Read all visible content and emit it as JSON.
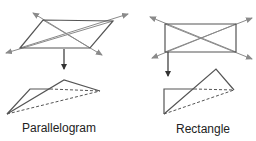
{
  "colors": {
    "edge": "#555555",
    "diagonal": "#8a8a8a",
    "arrow": "#333333",
    "label": "#222222"
  },
  "figures": [
    {
      "id": "parallelogram",
      "label": "Parallelogram",
      "label_pos": [
        22,
        121
      ],
      "shape": [
        [
          43,
          20
        ],
        [
          113,
          21
        ],
        [
          90,
          48
        ],
        [
          20,
          48
        ]
      ],
      "diagonal_arrows": [
        {
          "from": [
            90,
            48
          ],
          "to": [
            33,
            13
          ]
        },
        {
          "from": [
            20,
            48
          ],
          "to": [
            128,
            14
          ]
        },
        {
          "from": [
            113,
            21
          ],
          "to": [
            6,
            53
          ]
        },
        {
          "from": [
            43,
            20
          ],
          "to": [
            102,
            55
          ]
        }
      ],
      "fold_arrow": {
        "x": 64,
        "y1": 49,
        "y2": 69
      },
      "folded": {
        "solid": [
          [
            [
              7,
              114
            ],
            [
              30,
              89
            ],
            [
              50,
              89
            ]
          ],
          [
            [
              7,
              114
            ],
            [
              64,
              80
            ],
            [
              100,
              91
            ]
          ]
        ],
        "dashed": [
          [
            [
              50,
              89
            ],
            [
              100,
              91
            ]
          ],
          [
            [
              7,
              114
            ],
            [
              100,
              91
            ]
          ]
        ]
      }
    },
    {
      "id": "rectangle",
      "label": "Rectangle",
      "label_pos": [
        176,
        122
      ],
      "shape": [
        [
          165,
          24
        ],
        [
          236,
          24
        ],
        [
          236,
          52
        ],
        [
          165,
          52
        ]
      ],
      "diagonal_arrows": [
        {
          "from": [
            236,
            52
          ],
          "to": [
            150,
            17
          ]
        },
        {
          "from": [
            165,
            52
          ],
          "to": [
            252,
            18
          ]
        },
        {
          "from": [
            236,
            24
          ],
          "to": [
            152,
            58
          ]
        },
        {
          "from": [
            165,
            24
          ],
          "to": [
            252,
            59
          ]
        }
      ],
      "fold_arrow": {
        "x": 168,
        "y1": 52,
        "y2": 76
      },
      "folded": {
        "solid": [
          [
            [
              164,
              114
            ],
            [
              164,
              89
            ],
            [
              194,
              89
            ]
          ],
          [
            [
              164,
              114
            ],
            [
              216,
              69
            ],
            [
              234,
              90
            ]
          ]
        ],
        "dashed": [
          [
            [
              194,
              89
            ],
            [
              234,
              90
            ]
          ],
          [
            [
              164,
              114
            ],
            [
              234,
              90
            ]
          ]
        ]
      }
    }
  ]
}
